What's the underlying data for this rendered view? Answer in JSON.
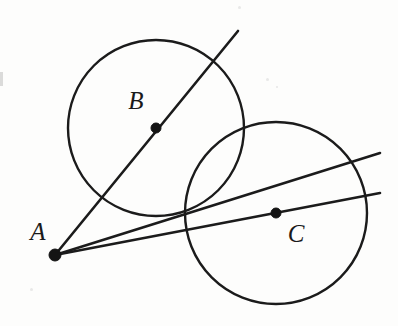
{
  "figure": {
    "background_color": "#fdfdfc",
    "ink_color": "#1b1b1b",
    "width": 398,
    "height": 326
  },
  "points": [
    {
      "id": "A",
      "label": "A",
      "role": "external-point",
      "x": 55,
      "y": 255,
      "dot_radius": 6,
      "label_x": 38,
      "label_y": 234
    },
    {
      "id": "B",
      "label": "B",
      "role": "circle-center",
      "x": 156,
      "y": 128,
      "dot_radius": 5,
      "label_x": 136,
      "label_y": 103
    },
    {
      "id": "C",
      "label": "C",
      "role": "circle-center",
      "x": 276,
      "y": 213,
      "dot_radius": 5,
      "label_x": 296,
      "label_y": 236
    }
  ],
  "circles": [
    {
      "id": "circle-B",
      "center_label": "B",
      "cx": 156,
      "cy": 128,
      "r": 88,
      "stroke_width": 2.4
    },
    {
      "id": "circle-C",
      "center_label": "C",
      "cx": 276,
      "cy": 213,
      "r": 91,
      "stroke_width": 2.6
    }
  ],
  "lines": [
    {
      "id": "line-A-through-B",
      "description": "Line from A through center B continuing beyond circle B",
      "x1": 55,
      "y1": 255,
      "x2": 238,
      "y2": 31,
      "stroke_width": 2.6
    },
    {
      "id": "line-A-upper-secant",
      "description": "Upper line from A crossing both circles to the right edge",
      "x1": 55,
      "y1": 255,
      "x2": 380,
      "y2": 153,
      "stroke_width": 2.6
    },
    {
      "id": "line-A-through-C",
      "description": "Lower line from A through center C to the right edge",
      "x1": 55,
      "y1": 255,
      "x2": 380,
      "y2": 193,
      "stroke_width": 2.6
    }
  ],
  "artifacts": [
    {
      "id": "left-edge-mark",
      "x": 0,
      "y": 72,
      "width": 3,
      "height": 14
    },
    {
      "id": "speck-upper-right",
      "x": 266,
      "y": 78,
      "size": 3
    },
    {
      "id": "speck-mid-right",
      "x": 276,
      "y": 86,
      "size": 2
    },
    {
      "id": "speck-lower-left",
      "x": 30,
      "y": 288,
      "size": 3
    },
    {
      "id": "speck-top-right",
      "x": 238,
      "y": 6,
      "size": 3
    }
  ]
}
